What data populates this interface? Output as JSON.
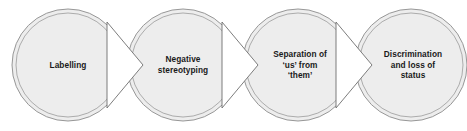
{
  "diagram": {
    "type": "process-flow",
    "orientation": "left-to-right",
    "background_color": "#ffffff",
    "node_fill_color": "#ededed",
    "node_border_color": "#8c8c8c",
    "connector_fill_color": "#ffffff",
    "connector_border_color": "#6e6e6e",
    "text_color": "#1a1a1a",
    "node_shape": "double-ring-circle",
    "connector_shape": "right-pointing-chevron",
    "stages": [
      {
        "id": "stage-1",
        "index": 1,
        "lines": [
          "Labelling"
        ],
        "center_x": 68,
        "center_y": 65,
        "radius_outer": 56,
        "radius_inner": 52
      },
      {
        "id": "stage-2",
        "index": 2,
        "lines": [
          "Negative",
          "stereotyping"
        ],
        "center_x": 183,
        "center_y": 65,
        "radius_outer": 56,
        "radius_inner": 52
      },
      {
        "id": "stage-3",
        "index": 3,
        "lines": [
          "Separation of",
          "‘us’ from",
          "‘them’"
        ],
        "center_x": 298,
        "center_y": 65,
        "radius_outer": 56,
        "radius_inner": 52
      },
      {
        "id": "stage-4",
        "index": 4,
        "lines": [
          "Discrimination",
          "and loss of",
          "status"
        ],
        "center_x": 411,
        "center_y": 65,
        "radius_outer": 56,
        "radius_inner": 52
      }
    ],
    "connectors": [
      {
        "id": "connector-1-2",
        "from": "stage-1",
        "to": "stage-2",
        "points": "107,22 143,65 107,108"
      },
      {
        "id": "connector-2-3",
        "from": "stage-2",
        "to": "stage-3",
        "points": "222,22 258,65 222,108"
      },
      {
        "id": "connector-3-4",
        "from": "stage-3",
        "to": "stage-4",
        "points": "336,22 372,65 336,108"
      }
    ]
  }
}
